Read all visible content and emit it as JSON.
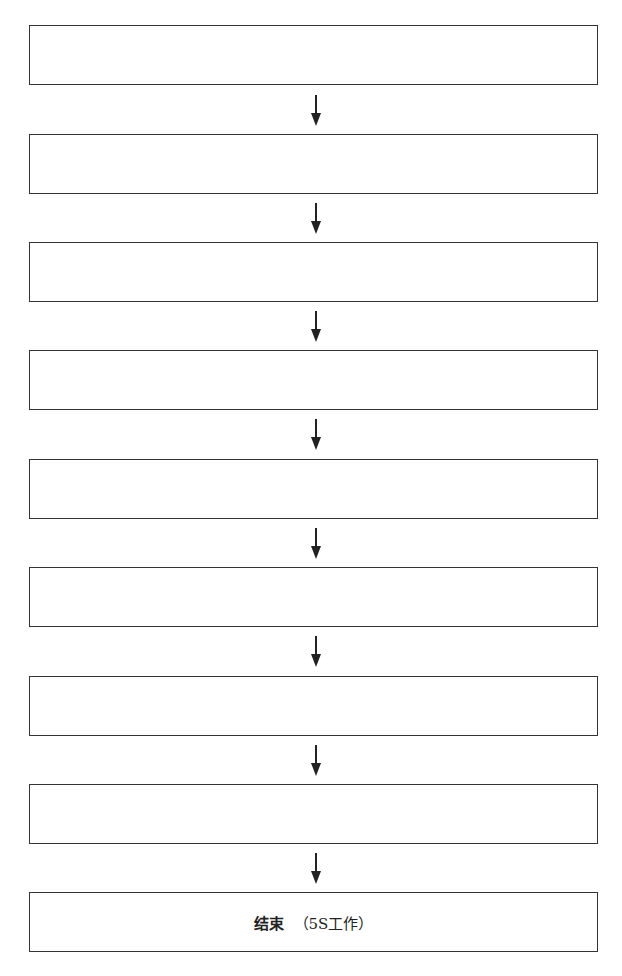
{
  "diagram": {
    "type": "flowchart",
    "direction": "top-to-bottom",
    "boxes": [
      {
        "label": "",
        "top": 25
      },
      {
        "label": "",
        "top": 134
      },
      {
        "label": "",
        "top": 242
      },
      {
        "label": "",
        "top": 350
      },
      {
        "label": "",
        "top": 459
      },
      {
        "label": "",
        "top": 567
      },
      {
        "label": "",
        "top": 676
      },
      {
        "label": "",
        "top": 784
      },
      {
        "label_main": "结束",
        "label_sub": "（5S工作）",
        "top": 892
      }
    ],
    "arrow_count": 8,
    "colors": {
      "line": "#333333",
      "background": "#ffffff",
      "text": "#222222"
    }
  }
}
